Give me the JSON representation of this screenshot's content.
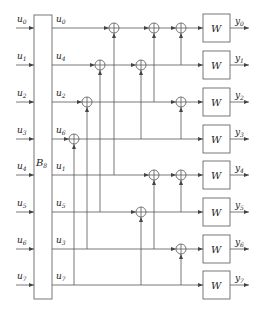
{
  "diagram": {
    "permutation_block": {
      "label": "B",
      "subscript": "8"
    },
    "channel_label": "W",
    "inputs": [
      {
        "base": "u",
        "sub": "0"
      },
      {
        "base": "u",
        "sub": "1"
      },
      {
        "base": "u",
        "sub": "2"
      },
      {
        "base": "u",
        "sub": "3"
      },
      {
        "base": "u",
        "sub": "4"
      },
      {
        "base": "u",
        "sub": "5"
      },
      {
        "base": "u",
        "sub": "6"
      },
      {
        "base": "u",
        "sub": "7"
      }
    ],
    "permuted": [
      {
        "base": "u",
        "sub": "0"
      },
      {
        "base": "u",
        "sub": "4"
      },
      {
        "base": "u",
        "sub": "2"
      },
      {
        "base": "u",
        "sub": "6"
      },
      {
        "base": "u",
        "sub": "1"
      },
      {
        "base": "u",
        "sub": "5"
      },
      {
        "base": "u",
        "sub": "3"
      },
      {
        "base": "u",
        "sub": "7"
      }
    ],
    "outputs": [
      {
        "base": "y",
        "sub": "0"
      },
      {
        "base": "y",
        "sub": "1"
      },
      {
        "base": "y",
        "sub": "2"
      },
      {
        "base": "y",
        "sub": "3"
      },
      {
        "base": "y",
        "sub": "4"
      },
      {
        "base": "y",
        "sub": "5"
      },
      {
        "base": "y",
        "sub": "6"
      },
      {
        "base": "y",
        "sub": "7"
      }
    ],
    "xor_gates": [
      {
        "stage": 0,
        "target_row": 3,
        "source_row": 7
      },
      {
        "stage": 1,
        "target_row": 2,
        "source_row": 6
      },
      {
        "stage": 2,
        "target_row": 1,
        "source_row": 5
      },
      {
        "stage": 3,
        "target_row": 0,
        "source_row": 4
      },
      {
        "stage": 4,
        "target_row": 1,
        "source_row": 3
      },
      {
        "stage": 4,
        "target_row": 5,
        "source_row": 7
      },
      {
        "stage": 5,
        "target_row": 0,
        "source_row": 2
      },
      {
        "stage": 5,
        "target_row": 4,
        "source_row": 6
      },
      {
        "stage": 6,
        "target_row": 0,
        "source_row": 1
      },
      {
        "stage": 6,
        "target_row": 2,
        "source_row": 3
      },
      {
        "stage": 6,
        "target_row": 4,
        "source_row": 5
      },
      {
        "stage": 6,
        "target_row": 6,
        "source_row": 7
      }
    ]
  }
}
